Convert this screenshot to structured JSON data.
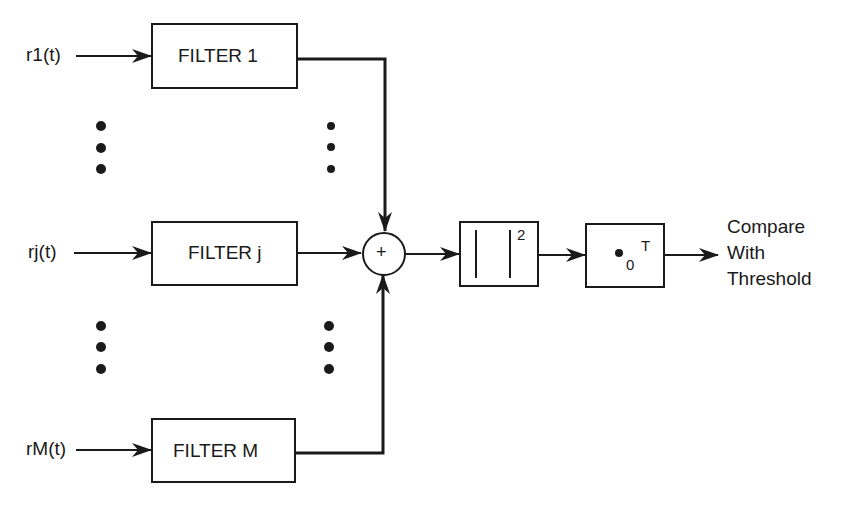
{
  "diagram": {
    "type": "block-diagram",
    "inputs": [
      {
        "label": "r1(t)",
        "filter": "FILTER 1"
      },
      {
        "label": "rj(t)",
        "filter": "FILTER j"
      },
      {
        "label": "rM(t)",
        "filter": "FILTER M"
      }
    ],
    "summer": {
      "symbol": "+"
    },
    "square_block": {
      "exponent": "2"
    },
    "integrator_block": {
      "lower_limit": "0",
      "upper_limit": "T"
    },
    "output": {
      "line1": "Compare",
      "line2": "With",
      "line3": "Threshold"
    },
    "colors": {
      "line": "#1a1a1a",
      "background": "#ffffff"
    }
  }
}
